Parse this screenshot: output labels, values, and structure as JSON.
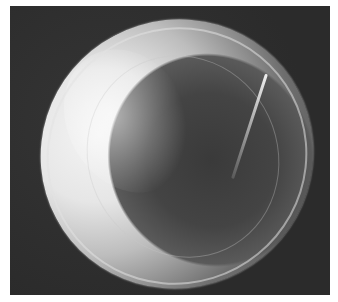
{
  "image": {
    "description": "Grayscale scanning electron micrograph of a single rounded grain (pollen/spore-like) with a ridged rim on a dark background",
    "colors": {
      "background_margin": "#ffffff",
      "frame_background": "#2e2e2e",
      "grain_highlight": "#f2f2f2",
      "grain_shadow": "#3a3a3a"
    }
  }
}
